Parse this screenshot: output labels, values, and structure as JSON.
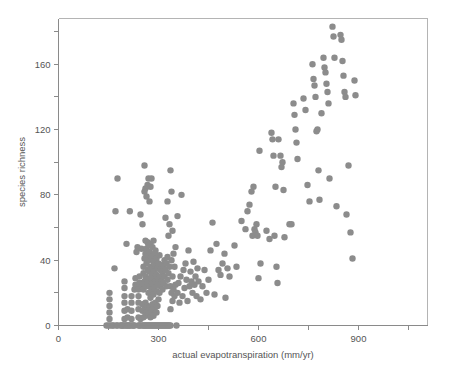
{
  "chart_data": {
    "type": "scatter",
    "title": "",
    "xlabel": "actual evapotranspiration (mm/yr)",
    "ylabel": "species richness",
    "xlim": [
      0,
      1107
    ],
    "ylim": [
      0,
      188
    ],
    "grid": false,
    "legend": null,
    "marker": {
      "shape": "circle",
      "color": "#8c8c8c",
      "size": 4.2
    },
    "xticks": [
      0,
      150,
      300,
      450,
      600,
      750,
      900,
      1050
    ],
    "xticklabels": [
      "0",
      "",
      "300",
      "",
      "600",
      "",
      "900",
      ""
    ],
    "xticklabels_shown": [
      "0",
      "300",
      "600",
      "900"
    ],
    "yticks": [
      0,
      20,
      40,
      60,
      80,
      100,
      120,
      140,
      160,
      180
    ],
    "yticklabels": [
      "0",
      "",
      "40",
      "",
      "80",
      "",
      "120",
      "",
      "160",
      ""
    ],
    "yticklabels_shown": [
      "0",
      "40",
      "80",
      "120",
      "160"
    ],
    "n_points": 279,
    "points": [
      [
        144,
        0
      ],
      [
        150,
        0
      ],
      [
        153,
        4
      ],
      [
        153,
        8
      ],
      [
        153,
        12
      ],
      [
        153,
        16
      ],
      [
        153,
        20
      ],
      [
        156,
        0
      ],
      [
        162,
        0
      ],
      [
        165,
        0
      ],
      [
        168,
        35
      ],
      [
        171,
        70
      ],
      [
        174,
        0
      ],
      [
        177,
        0
      ],
      [
        177,
        90
      ],
      [
        186,
        0
      ],
      [
        189,
        0
      ],
      [
        192,
        0
      ],
      [
        195,
        0
      ],
      [
        198,
        4
      ],
      [
        198,
        9
      ],
      [
        198,
        14
      ],
      [
        198,
        18
      ],
      [
        198,
        23
      ],
      [
        198,
        27
      ],
      [
        200,
        0
      ],
      [
        203,
        0
      ],
      [
        204,
        50
      ],
      [
        207,
        0
      ],
      [
        207,
        5
      ],
      [
        207,
        10
      ],
      [
        210,
        0
      ],
      [
        213,
        0
      ],
      [
        214,
        70
      ],
      [
        216,
        0
      ],
      [
        219,
        4
      ],
      [
        219,
        9
      ],
      [
        219,
        14
      ],
      [
        219,
        18
      ],
      [
        222,
        0
      ],
      [
        225,
        0
      ],
      [
        228,
        0
      ],
      [
        228,
        22
      ],
      [
        231,
        25
      ],
      [
        231,
        29
      ],
      [
        234,
        24
      ],
      [
        234,
        45
      ],
      [
        237,
        25
      ],
      [
        237,
        48
      ],
      [
        240,
        0
      ],
      [
        240,
        5
      ],
      [
        240,
        10
      ],
      [
        240,
        14
      ],
      [
        240,
        18
      ],
      [
        240,
        22
      ],
      [
        243,
        0
      ],
      [
        243,
        26
      ],
      [
        243,
        30
      ],
      [
        246,
        0
      ],
      [
        246,
        4
      ],
      [
        246,
        68
      ],
      [
        249,
        24
      ],
      [
        249,
        47
      ],
      [
        252,
        0
      ],
      [
        252,
        9
      ],
      [
        252,
        13
      ],
      [
        252,
        26
      ],
      [
        252,
        62
      ],
      [
        255,
        0
      ],
      [
        255,
        5
      ],
      [
        255,
        22
      ],
      [
        255,
        32
      ],
      [
        255,
        36
      ],
      [
        258,
        0
      ],
      [
        258,
        10
      ],
      [
        258,
        27
      ],
      [
        258,
        41
      ],
      [
        258,
        82
      ],
      [
        258,
        98
      ],
      [
        261,
        0
      ],
      [
        261,
        6
      ],
      [
        261,
        14
      ],
      [
        261,
        30
      ],
      [
        261,
        44
      ],
      [
        261,
        52
      ],
      [
        261,
        84
      ],
      [
        264,
        0
      ],
      [
        264,
        8
      ],
      [
        264,
        24
      ],
      [
        264,
        38
      ],
      [
        264,
        47
      ],
      [
        264,
        79
      ],
      [
        267,
        0
      ],
      [
        267,
        12
      ],
      [
        267,
        26
      ],
      [
        267,
        34
      ],
      [
        267,
        43
      ],
      [
        267,
        51
      ],
      [
        267,
        86
      ],
      [
        270,
        0
      ],
      [
        270,
        7
      ],
      [
        270,
        20
      ],
      [
        270,
        28
      ],
      [
        270,
        40
      ],
      [
        270,
        49
      ],
      [
        270,
        90
      ],
      [
        273,
        0
      ],
      [
        273,
        11
      ],
      [
        273,
        24
      ],
      [
        273,
        33
      ],
      [
        273,
        45
      ],
      [
        273,
        76
      ],
      [
        276,
        0
      ],
      [
        276,
        5
      ],
      [
        276,
        17
      ],
      [
        276,
        29
      ],
      [
        276,
        36
      ],
      [
        276,
        50
      ],
      [
        276,
        85
      ],
      [
        279,
        0
      ],
      [
        279,
        9
      ],
      [
        279,
        22
      ],
      [
        279,
        31
      ],
      [
        279,
        42
      ],
      [
        279,
        90
      ],
      [
        282,
        0
      ],
      [
        282,
        13
      ],
      [
        282,
        26
      ],
      [
        282,
        35
      ],
      [
        282,
        48
      ],
      [
        285,
        0
      ],
      [
        285,
        6
      ],
      [
        285,
        19
      ],
      [
        285,
        29
      ],
      [
        285,
        39
      ],
      [
        285,
        52
      ],
      [
        288,
        0
      ],
      [
        288,
        10
      ],
      [
        288,
        23
      ],
      [
        288,
        33
      ],
      [
        288,
        44
      ],
      [
        291,
        0
      ],
      [
        291,
        14
      ],
      [
        291,
        27
      ],
      [
        291,
        37
      ],
      [
        291,
        46
      ],
      [
        294,
        0
      ],
      [
        294,
        8
      ],
      [
        294,
        21
      ],
      [
        294,
        31
      ],
      [
        294,
        41
      ],
      [
        297,
        0
      ],
      [
        297,
        12
      ],
      [
        297,
        25
      ],
      [
        297,
        35
      ],
      [
        300,
        0
      ],
      [
        300,
        16
      ],
      [
        300,
        28
      ],
      [
        300,
        38
      ],
      [
        303,
        0
      ],
      [
        303,
        20
      ],
      [
        303,
        30
      ],
      [
        303,
        43
      ],
      [
        306,
        0
      ],
      [
        306,
        24
      ],
      [
        306,
        34
      ],
      [
        309,
        0
      ],
      [
        309,
        27
      ],
      [
        309,
        37
      ],
      [
        312,
        0
      ],
      [
        312,
        22
      ],
      [
        312,
        33
      ],
      [
        315,
        0
      ],
      [
        315,
        26
      ],
      [
        315,
        36
      ],
      [
        318,
        0
      ],
      [
        318,
        30
      ],
      [
        318,
        40
      ],
      [
        321,
        0
      ],
      [
        321,
        34
      ],
      [
        321,
        66
      ],
      [
        324,
        0
      ],
      [
        324,
        24
      ],
      [
        324,
        38
      ],
      [
        327,
        0
      ],
      [
        327,
        28
      ],
      [
        327,
        42
      ],
      [
        327,
        76
      ],
      [
        330,
        0
      ],
      [
        330,
        32
      ],
      [
        330,
        55
      ],
      [
        333,
        0
      ],
      [
        333,
        36
      ],
      [
        333,
        62
      ],
      [
        336,
        0
      ],
      [
        336,
        10
      ],
      [
        336,
        24
      ],
      [
        336,
        95
      ],
      [
        339,
        20
      ],
      [
        339,
        40
      ],
      [
        339,
        82
      ],
      [
        342,
        15
      ],
      [
        342,
        30
      ],
      [
        342,
        58
      ],
      [
        345,
        22
      ],
      [
        345,
        44
      ],
      [
        348,
        18
      ],
      [
        348,
        36
      ],
      [
        351,
        25
      ],
      [
        351,
        48
      ],
      [
        354,
        0
      ],
      [
        357,
        20
      ],
      [
        357,
        67
      ],
      [
        360,
        26
      ],
      [
        363,
        14
      ],
      [
        366,
        30
      ],
      [
        369,
        80
      ],
      [
        372,
        18
      ],
      [
        375,
        34
      ],
      [
        378,
        23
      ],
      [
        381,
        38
      ],
      [
        384,
        28
      ],
      [
        387,
        15
      ],
      [
        390,
        46
      ],
      [
        393,
        24
      ],
      [
        396,
        33
      ],
      [
        399,
        27
      ],
      [
        402,
        20
      ],
      [
        405,
        39
      ],
      [
        408,
        25
      ],
      [
        411,
        30
      ],
      [
        414,
        18
      ],
      [
        417,
        35
      ],
      [
        420,
        27
      ],
      [
        426,
        16
      ],
      [
        432,
        24
      ],
      [
        438,
        34
      ],
      [
        444,
        20
      ],
      [
        450,
        28
      ],
      [
        456,
        46
      ],
      [
        462,
        63
      ],
      [
        468,
        19
      ],
      [
        474,
        50
      ],
      [
        480,
        34
      ],
      [
        486,
        31
      ],
      [
        492,
        38
      ],
      [
        498,
        44
      ],
      [
        501,
        17
      ],
      [
        507,
        35
      ],
      [
        513,
        30
      ],
      [
        528,
        49
      ],
      [
        534,
        36
      ],
      [
        549,
        64
      ],
      [
        561,
        59
      ],
      [
        567,
        70
      ],
      [
        573,
        74
      ],
      [
        579,
        82
      ],
      [
        582,
        55
      ],
      [
        585,
        85
      ],
      [
        588,
        59
      ],
      [
        591,
        57
      ],
      [
        594,
        62
      ],
      [
        597,
        55
      ],
      [
        600,
        29
      ],
      [
        603,
        107
      ],
      [
        606,
        38
      ],
      [
        624,
        58
      ],
      [
        633,
        53
      ],
      [
        639,
        118
      ],
      [
        642,
        114
      ],
      [
        645,
        104
      ],
      [
        648,
        55
      ],
      [
        651,
        85
      ],
      [
        654,
        36
      ],
      [
        657,
        26
      ],
      [
        660,
        114
      ],
      [
        666,
        104
      ],
      [
        669,
        97
      ],
      [
        672,
        100
      ],
      [
        675,
        83
      ],
      [
        678,
        54
      ],
      [
        693,
        62
      ],
      [
        699,
        62
      ],
      [
        705,
        136
      ],
      [
        708,
        129
      ],
      [
        711,
        120
      ],
      [
        714,
        112
      ],
      [
        717,
        102
      ],
      [
        735,
        139
      ],
      [
        741,
        132
      ],
      [
        747,
        86
      ],
      [
        753,
        76
      ],
      [
        762,
        160
      ],
      [
        765,
        151
      ],
      [
        768,
        147
      ],
      [
        771,
        140
      ],
      [
        774,
        119
      ],
      [
        777,
        120
      ],
      [
        780,
        95
      ],
      [
        783,
        77
      ],
      [
        789,
        130
      ],
      [
        795,
        164
      ],
      [
        798,
        158
      ],
      [
        801,
        155
      ],
      [
        804,
        148
      ],
      [
        807,
        143
      ],
      [
        810,
        136
      ],
      [
        813,
        90
      ],
      [
        822,
        183
      ],
      [
        825,
        177
      ],
      [
        828,
        164
      ],
      [
        834,
        73
      ],
      [
        846,
        178
      ],
      [
        849,
        175
      ],
      [
        852,
        162
      ],
      [
        855,
        153
      ],
      [
        858,
        143
      ],
      [
        861,
        140
      ],
      [
        864,
        68
      ],
      [
        870,
        98
      ],
      [
        876,
        57
      ],
      [
        882,
        41
      ],
      [
        888,
        150
      ],
      [
        891,
        141
      ]
    ]
  }
}
